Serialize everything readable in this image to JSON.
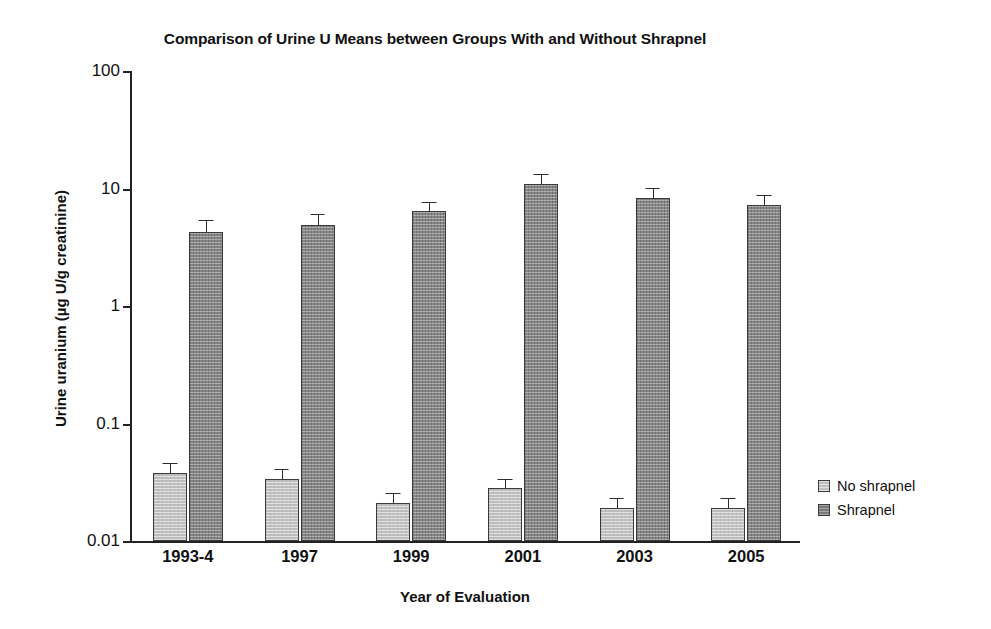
{
  "chart_data": {
    "type": "bar",
    "title": "Comparison of Urine U Means between Groups With and Without Shrapnel",
    "xlabel": "Year of Evaluation",
    "ylabel": "Urine uranium (µg U/g creatinine)",
    "yscale": "log",
    "ylim": [
      0.01,
      100
    ],
    "ytick_labels": [
      "100",
      "10",
      "1",
      "0.1",
      "0.01"
    ],
    "ytick_values": [
      100,
      10,
      1,
      0.1,
      0.01
    ],
    "grid": false,
    "legend_position": "right",
    "categories": [
      "1993-4",
      "1997",
      "1999",
      "2001",
      "2003",
      "2005"
    ],
    "series": [
      {
        "name": "No shrapnel",
        "color": "#bfbfbf",
        "values": [
          0.038,
          0.034,
          0.021,
          0.028,
          0.019,
          0.019
        ],
        "err_upper": [
          0.045,
          0.04,
          0.025,
          0.033,
          0.023,
          0.023
        ],
        "err_lower": [
          0.032,
          0.029,
          0.018,
          0.024,
          0.016,
          0.016
        ]
      },
      {
        "name": "Shrapnel",
        "color": "#8a8a8a",
        "values": [
          4.3,
          4.9,
          6.4,
          11.0,
          8.3,
          7.2
        ],
        "err_upper": [
          5.3,
          6.0,
          7.6,
          13.0,
          9.9,
          8.6
        ],
        "err_lower": [
          3.5,
          4.0,
          5.4,
          9.3,
          7.0,
          6.0
        ]
      }
    ]
  },
  "legend": {
    "items": [
      {
        "label": "No shrapnel"
      },
      {
        "label": "Shrapnel"
      }
    ]
  }
}
